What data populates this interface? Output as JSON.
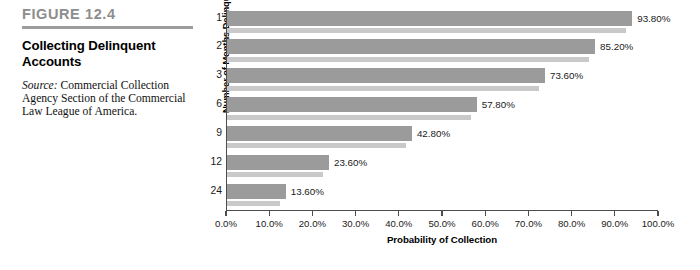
{
  "caption": {
    "figure_number": "FIGURE 12.4",
    "title": "Collecting Delinquent Accounts",
    "source_label": "Source:",
    "source_text": " Commercial Collection Agency Section of the Commercial Law League of America."
  },
  "colors": {
    "figure_number": "#8d8d8d",
    "rule": "#9d9d9d",
    "bar_main": "#9b9b9b",
    "bar_shadow": "#c9c9c9",
    "axis": "#4d4d4d",
    "text": "#1a1a1a"
  },
  "chart_data": {
    "type": "bar",
    "orientation": "horizontal",
    "title": "Collecting Delinquent Accounts",
    "xlabel": "Probability of Collection",
    "ylabel": "Number of Months Delinquent",
    "categories": [
      "1",
      "2",
      "3",
      "6",
      "9",
      "12",
      "24"
    ],
    "values": [
      93.8,
      85.2,
      73.6,
      57.8,
      42.8,
      23.6,
      13.6
    ],
    "data_labels": [
      "93.80%",
      "85.20%",
      "73.60%",
      "57.80%",
      "42.80%",
      "23.60%",
      "13.60%"
    ],
    "xlim": [
      0,
      100
    ],
    "xticks": [
      0,
      10,
      20,
      30,
      40,
      50,
      60,
      70,
      80,
      90,
      100
    ],
    "xtick_labels": [
      "0.0%",
      "10.0%",
      "20.0%",
      "30.0%",
      "40.0%",
      "50.0%",
      "60.0%",
      "70.0%",
      "80.0%",
      "90.0%",
      "100.0%"
    ],
    "grid": false,
    "legend": null,
    "series": [
      {
        "name": "Probability of Collection",
        "values": [
          93.8,
          85.2,
          73.6,
          57.8,
          42.8,
          23.6,
          13.6
        ]
      }
    ]
  }
}
